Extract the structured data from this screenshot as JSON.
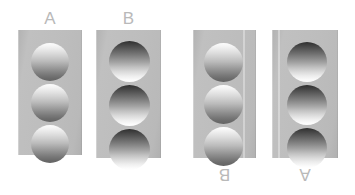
{
  "figure": {
    "background_color": "#ffffff",
    "width": 355,
    "height": 195
  },
  "style": {
    "panel_color": "#bdbdbd",
    "label_color": "#b9b9b9",
    "disc_highlight_color": "#ffffff",
    "disc_shadow_color": "#2f2f2f"
  },
  "panels": [
    {
      "id": "panel-a",
      "label": "A",
      "label_position": "top",
      "label_rotated": false,
      "x": 18,
      "y": 30,
      "width": 64,
      "height": 125,
      "disc_count": 3,
      "disc_diameter": 38,
      "shading": "light-top",
      "percept": "convex",
      "seam": false
    },
    {
      "id": "panel-b",
      "label": "B",
      "label_position": "top",
      "label_rotated": false,
      "x": 96,
      "y": 30,
      "width": 65,
      "height": 128,
      "disc_count": 3,
      "disc_diameter": 41,
      "shading": "dark-top",
      "percept": "concave",
      "seam": false
    },
    {
      "id": "panel-b-rotated",
      "label": "B",
      "label_position": "bottom",
      "label_rotated": true,
      "x": 193,
      "y": 30,
      "width": 63,
      "height": 128,
      "disc_count": 3,
      "disc_diameter": 39,
      "shading": "light-top",
      "percept": "convex",
      "seam": true,
      "seam_x": 50
    },
    {
      "id": "panel-a-rotated",
      "label": "A",
      "label_position": "bottom",
      "label_rotated": true,
      "x": 272,
      "y": 30,
      "width": 66,
      "height": 128,
      "disc_count": 3,
      "disc_diameter": 40,
      "shading": "dark-top",
      "percept": "concave",
      "seam": true,
      "seam_x": 6
    }
  ],
  "labels": {
    "top_left": "A",
    "top_right": "B",
    "bottom_left": "B",
    "bottom_right": "A"
  }
}
